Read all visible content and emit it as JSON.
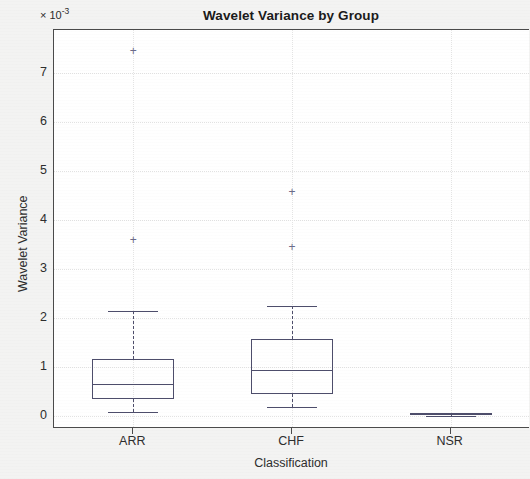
{
  "chart_data": {
    "type": "box",
    "title": "Wavelet Variance by Group",
    "xlabel": "Classification",
    "ylabel": "Wavelet Variance",
    "y_exponent_label": "× 10",
    "y_exponent_power": "-3",
    "y_scale_factor": 0.001,
    "categories": [
      "ARR",
      "CHF",
      "NSR"
    ],
    "yticks": [
      0,
      1,
      2,
      3,
      4,
      5,
      6,
      7
    ],
    "ytick_labels": [
      "0",
      "1",
      "2",
      "3",
      "4",
      "5",
      "6",
      "7"
    ],
    "ylim": [
      -0.27,
      7.88
    ],
    "grid": true,
    "legend": "none",
    "box_color": "#4d4d6b",
    "outlier_color": "#6b6b8a",
    "axis_color": "#4a4a4a",
    "plot_background": "#ffffff",
    "figure_background": "#f3f3f2",
    "boxes": [
      {
        "label": "ARR",
        "whisker_low": 0.08,
        "q1": 0.35,
        "median": 0.64,
        "q3": 1.15,
        "whisker_high": 2.15,
        "outliers": [
          3.6,
          7.45
        ]
      },
      {
        "label": "CHF",
        "whisker_low": 0.18,
        "q1": 0.45,
        "median": 0.93,
        "q3": 1.56,
        "whisker_high": 2.25,
        "outliers": [
          3.45,
          4.58
        ]
      },
      {
        "label": "NSR",
        "whisker_low": 0.0,
        "q1": 0.01,
        "median": 0.03,
        "q3": 0.05,
        "whisker_high": 0.06,
        "outliers": []
      }
    ]
  }
}
